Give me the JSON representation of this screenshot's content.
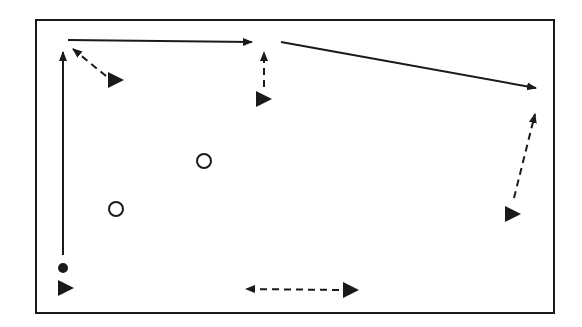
{
  "diagram": {
    "type": "drill-diagram",
    "colors": {
      "stroke": "#1a1a1a",
      "background": "#ffffff"
    },
    "field": {
      "x": 36,
      "y": 20,
      "width": 518,
      "height": 293
    },
    "players": [
      {
        "id": "p1",
        "x": 65,
        "y": 288
      },
      {
        "id": "p2",
        "x": 115,
        "y": 80
      },
      {
        "id": "p3",
        "x": 263,
        "y": 99
      },
      {
        "id": "p4",
        "x": 512,
        "y": 214
      },
      {
        "id": "p5",
        "x": 350,
        "y": 290
      }
    ],
    "cones": [
      {
        "id": "c1",
        "x": 204,
        "y": 161
      },
      {
        "id": "c2",
        "x": 116,
        "y": 209
      }
    ],
    "ball": {
      "x": 63,
      "y": 268
    },
    "runs": [
      {
        "id": "r1",
        "style": "solid",
        "from": [
          63,
          255
        ],
        "to": [
          63,
          52
        ]
      },
      {
        "id": "r2",
        "style": "solid",
        "from": [
          68,
          40
        ],
        "to": [
          252,
          42
        ]
      },
      {
        "id": "r3",
        "style": "solid",
        "from": [
          281,
          42
        ],
        "to": [
          536,
          88
        ]
      }
    ],
    "passes": [
      {
        "id": "d1",
        "style": "dashed",
        "from": [
          106,
          76
        ],
        "to": [
          73,
          49
        ]
      },
      {
        "id": "d2",
        "style": "dashed",
        "from": [
          264,
          87
        ],
        "to": [
          264,
          52
        ]
      },
      {
        "id": "d3",
        "style": "dashed",
        "from": [
          514,
          198
        ],
        "to": [
          535,
          114
        ]
      },
      {
        "id": "d4",
        "style": "dashed",
        "from": [
          339,
          290
        ],
        "to": [
          246,
          289
        ]
      }
    ]
  }
}
